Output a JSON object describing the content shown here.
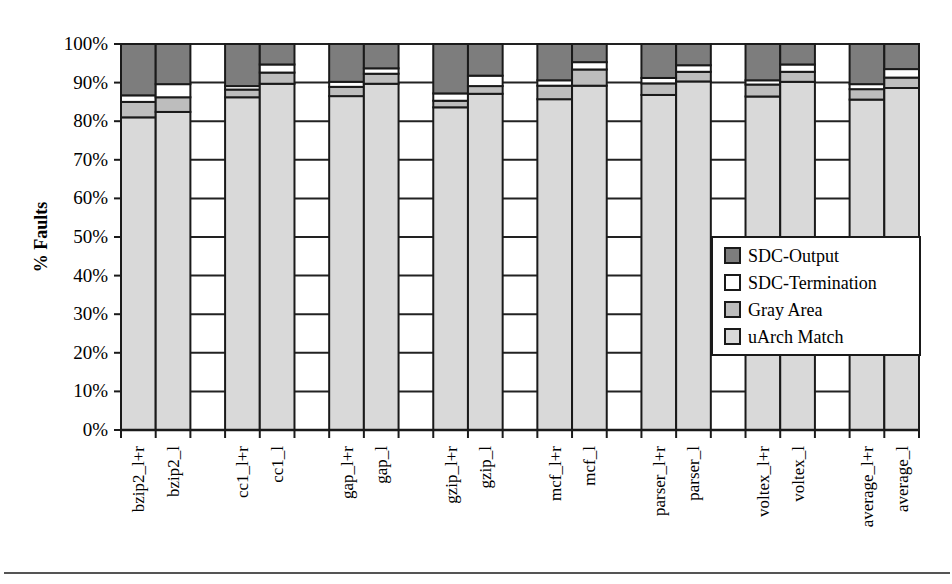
{
  "chart_data": {
    "type": "bar",
    "stacked": true,
    "title": "",
    "xlabel": "",
    "ylabel": "% Faults",
    "ylim": [
      0,
      100
    ],
    "yticks": [
      "0%",
      "10%",
      "20%",
      "30%",
      "40%",
      "50%",
      "60%",
      "70%",
      "80%",
      "90%",
      "100%"
    ],
    "grid": true,
    "legend_position": "inside-right",
    "categories": [
      "bzip2_l+r",
      "bzip2_l",
      "",
      "cc1_l+r",
      "cc1_l",
      "",
      "gap_l+r",
      "gap_l",
      "",
      "gzip_l+r",
      "gzip_l",
      "",
      "mcf_l+r",
      "mcf_l",
      "",
      "parser_l+r",
      "parser_l",
      "",
      "voltex_l+r",
      "voltex_l",
      "",
      "average_l+r",
      "average_l"
    ],
    "series": [
      {
        "name": "uArch Match",
        "color": "#d9d9d9",
        "values": [
          81.0,
          82.4,
          null,
          86.2,
          89.7,
          null,
          86.5,
          89.7,
          null,
          83.6,
          87.1,
          null,
          85.7,
          89.2,
          null,
          86.8,
          90.3,
          null,
          86.4,
          90.2,
          null,
          85.6,
          88.6
        ]
      },
      {
        "name": "Gray Area",
        "color": "#bdbdbd",
        "values": [
          4.0,
          3.8,
          null,
          2.0,
          2.9,
          null,
          2.4,
          2.6,
          null,
          1.7,
          2.0,
          null,
          3.5,
          4.2,
          null,
          3.0,
          2.5,
          null,
          3.1,
          2.6,
          null,
          2.7,
          2.7
        ]
      },
      {
        "name": "SDC-Termination",
        "color": "#ffffff",
        "values": [
          1.7,
          3.4,
          null,
          0.9,
          2.1,
          null,
          1.3,
          1.4,
          null,
          1.9,
          2.7,
          null,
          1.4,
          1.9,
          null,
          1.4,
          1.7,
          null,
          1.1,
          1.9,
          null,
          1.3,
          2.2
        ]
      },
      {
        "name": "SDC-Output",
        "color": "#7d7d7d",
        "values": [
          13.3,
          10.4,
          null,
          10.9,
          5.3,
          null,
          9.8,
          6.3,
          null,
          12.8,
          8.2,
          null,
          9.4,
          4.7,
          null,
          8.8,
          5.5,
          null,
          9.4,
          5.3,
          null,
          10.4,
          6.5
        ]
      }
    ],
    "legend": [
      {
        "label": "SDC-Output",
        "color": "#7d7d7d"
      },
      {
        "label": "SDC-Termination",
        "color": "#ffffff"
      },
      {
        "label": "Gray Area",
        "color": "#bdbdbd"
      },
      {
        "label": "uArch Match",
        "color": "#d9d9d9"
      }
    ]
  }
}
